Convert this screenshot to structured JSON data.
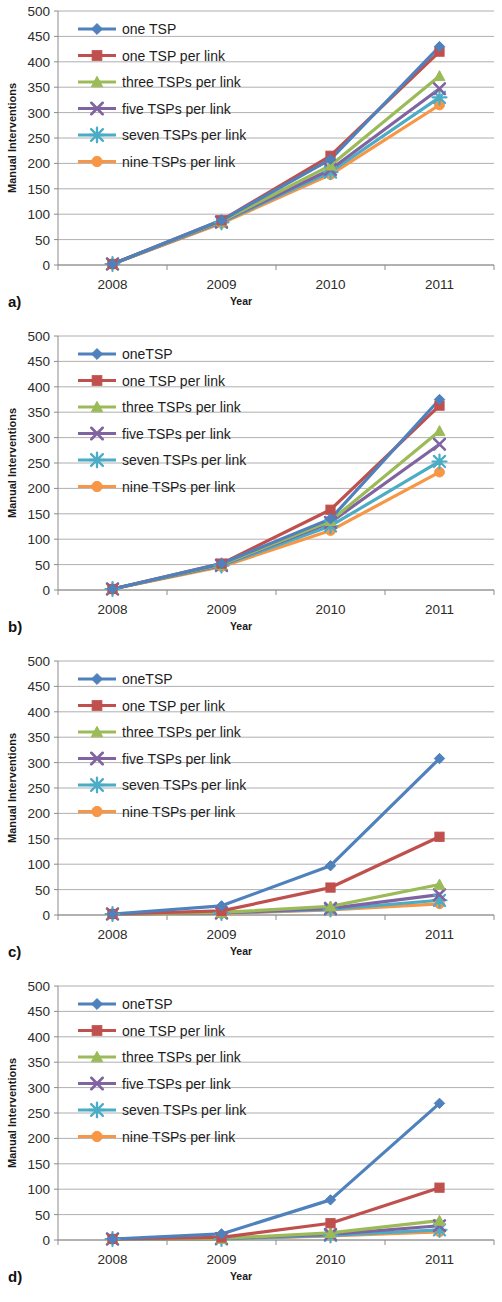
{
  "figure": {
    "panels": [
      {
        "letter": "a)",
        "legend_first_label": "one TSP",
        "chart_data": {
          "type": "line",
          "title": "",
          "xlabel": "Year",
          "ylabel": "Manual Interventions",
          "categories": [
            "2008",
            "2009",
            "2010",
            "2011"
          ],
          "x": [
            2008,
            2009,
            2010,
            2011
          ],
          "xtick_labels": [
            "2008",
            "2009",
            "2010",
            "2011"
          ],
          "ytick_labels": [
            "0",
            "50",
            "100",
            "150",
            "200",
            "250",
            "300",
            "350",
            "400",
            "450",
            "500"
          ],
          "yticks": [
            0,
            50,
            100,
            150,
            200,
            250,
            300,
            350,
            400,
            450,
            500
          ],
          "ylim": [
            0,
            500
          ],
          "grid": true,
          "legend_position": "inside-top-left",
          "series": [
            {
              "name": "one TSP",
              "color": "#4F81BD",
              "marker": "diamond",
              "values": [
                2,
                88,
                208,
                430
              ]
            },
            {
              "name": "one TSP per link",
              "color": "#C0504D",
              "marker": "square",
              "values": [
                2,
                88,
                215,
                420
              ]
            },
            {
              "name": "three TSPs per link",
              "color": "#9BBB59",
              "marker": "triangle",
              "values": [
                2,
                86,
                196,
                372
              ]
            },
            {
              "name": "five TSPs per link",
              "color": "#8064A2",
              "marker": "x",
              "values": [
                2,
                85,
                188,
                347
              ]
            },
            {
              "name": "seven TSPs per link",
              "color": "#4BACC6",
              "marker": "star",
              "values": [
                2,
                84,
                183,
                330
              ]
            },
            {
              "name": "nine TSPs per link",
              "color": "#F79646",
              "marker": "circle",
              "values": [
                2,
                82,
                178,
                315
              ]
            }
          ]
        }
      },
      {
        "letter": "b)",
        "legend_first_label": "oneTSP",
        "chart_data": {
          "type": "line",
          "title": "",
          "xlabel": "Year",
          "ylabel": "Manual Interventions",
          "categories": [
            "2008",
            "2009",
            "2010",
            "2011"
          ],
          "x": [
            2008,
            2009,
            2010,
            2011
          ],
          "xtick_labels": [
            "2008",
            "2009",
            "2010",
            "2011"
          ],
          "ytick_labels": [
            "0",
            "50",
            "100",
            "150",
            "200",
            "250",
            "300",
            "350",
            "400",
            "450",
            "500"
          ],
          "yticks": [
            0,
            50,
            100,
            150,
            200,
            250,
            300,
            350,
            400,
            450,
            500
          ],
          "ylim": [
            0,
            500
          ],
          "grid": true,
          "legend_position": "inside-top-left",
          "series": [
            {
              "name": "oneTSP",
              "color": "#4F81BD",
              "marker": "diamond",
              "values": [
                2,
                52,
                140,
                375
              ]
            },
            {
              "name": "one TSP per link",
              "color": "#C0504D",
              "marker": "square",
              "values": [
                2,
                52,
                158,
                363
              ]
            },
            {
              "name": "three TSPs per link",
              "color": "#9BBB59",
              "marker": "triangle",
              "values": [
                2,
                50,
                136,
                313
              ]
            },
            {
              "name": "five TSPs per link",
              "color": "#8064A2",
              "marker": "x",
              "values": [
                2,
                49,
                133,
                287
              ]
            },
            {
              "name": "seven TSPs per link",
              "color": "#4BACC6",
              "marker": "star",
              "values": [
                2,
                48,
                126,
                253
              ]
            },
            {
              "name": "nine TSPs per link",
              "color": "#F79646",
              "marker": "circle",
              "values": [
                2,
                46,
                117,
                232
              ]
            }
          ]
        }
      },
      {
        "letter": "c)",
        "legend_first_label": "oneTSP",
        "chart_data": {
          "type": "line",
          "title": "",
          "xlabel": "Year",
          "ylabel": "Manual Interventions",
          "categories": [
            "2008",
            "2009",
            "2010",
            "2011"
          ],
          "x": [
            2008,
            2009,
            2010,
            2011
          ],
          "xtick_labels": [
            "2008",
            "2009",
            "2010",
            "2011"
          ],
          "ytick_labels": [
            "0",
            "50",
            "100",
            "150",
            "200",
            "250",
            "300",
            "350",
            "400",
            "450",
            "500"
          ],
          "yticks": [
            0,
            50,
            100,
            150,
            200,
            250,
            300,
            350,
            400,
            450,
            500
          ],
          "ylim": [
            0,
            500
          ],
          "grid": true,
          "legend_position": "inside-top-left",
          "series": [
            {
              "name": "oneTSP",
              "color": "#4F81BD",
              "marker": "diamond",
              "values": [
                2,
                18,
                97,
                308
              ]
            },
            {
              "name": "one TSP per link",
              "color": "#C0504D",
              "marker": "square",
              "values": [
                2,
                8,
                54,
                154
              ]
            },
            {
              "name": "three TSPs per link",
              "color": "#9BBB59",
              "marker": "triangle",
              "values": [
                2,
                5,
                17,
                60
              ]
            },
            {
              "name": "five TSPs per link",
              "color": "#8064A2",
              "marker": "x",
              "values": [
                2,
                4,
                13,
                40
              ]
            },
            {
              "name": "seven TSPs per link",
              "color": "#4BACC6",
              "marker": "star",
              "values": [
                2,
                4,
                11,
                29
              ]
            },
            {
              "name": "nine TSPs per link",
              "color": "#F79646",
              "marker": "circle",
              "values": [
                2,
                3,
                10,
                22
              ]
            }
          ]
        }
      },
      {
        "letter": "d)",
        "legend_first_label": "oneTSP",
        "chart_data": {
          "type": "line",
          "title": "",
          "xlabel": "Year",
          "ylabel": "Manual Interventions",
          "categories": [
            "2008",
            "2009",
            "2010",
            "2011"
          ],
          "x": [
            2008,
            2009,
            2010,
            2011
          ],
          "xtick_labels": [
            "2008",
            "2009",
            "2010",
            "2011"
          ],
          "ytick_labels": [
            "0",
            "50",
            "100",
            "150",
            "200",
            "250",
            "300",
            "350",
            "400",
            "450",
            "500"
          ],
          "yticks": [
            0,
            50,
            100,
            150,
            200,
            250,
            300,
            350,
            400,
            450,
            500
          ],
          "ylim": [
            0,
            500
          ],
          "grid": true,
          "legend_position": "inside-top-left",
          "series": [
            {
              "name": "oneTSP",
              "color": "#4F81BD",
              "marker": "diamond",
              "values": [
                2,
                12,
                79,
                269
              ]
            },
            {
              "name": "one TSP per link",
              "color": "#C0504D",
              "marker": "square",
              "values": [
                2,
                5,
                33,
                103
              ]
            },
            {
              "name": "three TSPs per link",
              "color": "#9BBB59",
              "marker": "triangle",
              "values": [
                2,
                3,
                14,
                38
              ]
            },
            {
              "name": "five TSPs per link",
              "color": "#8064A2",
              "marker": "x",
              "values": [
                2,
                3,
                11,
                28
              ]
            },
            {
              "name": "seven TSPs per link",
              "color": "#4BACC6",
              "marker": "star",
              "values": [
                2,
                2,
                9,
                20
              ]
            },
            {
              "name": "nine TSPs per link",
              "color": "#F79646",
              "marker": "circle",
              "values": [
                2,
                2,
                8,
                16
              ]
            }
          ]
        }
      }
    ]
  }
}
